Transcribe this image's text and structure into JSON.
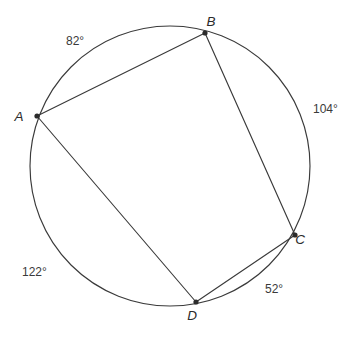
{
  "figure": {
    "type": "circle-with-inscribed-quadrilateral",
    "shape_name": "cyclic-quadrilateral-ABCD",
    "stroke_color": "#3a3a3a",
    "label_color": "#2b2b2b",
    "background_color": "#ffffff",
    "circle": {
      "center_x": 170,
      "center_y": 166,
      "radius": 140
    },
    "vertices": [
      {
        "id": "A",
        "label": "A",
        "x": 37,
        "y": 116,
        "label_x": 19,
        "label_y": 121
      },
      {
        "id": "B",
        "label": "B",
        "x": 205,
        "y": 33,
        "label_x": 211,
        "label_y": 26
      },
      {
        "id": "C",
        "label": "C",
        "x": 295,
        "y": 235,
        "label_x": 300,
        "label_y": 244
      },
      {
        "id": "D",
        "label": "D",
        "x": 196,
        "y": 302,
        "label_x": 192,
        "label_y": 320
      }
    ],
    "chords": [
      {
        "id": "AB",
        "from": "A",
        "to": "B"
      },
      {
        "id": "BC",
        "from": "B",
        "to": "C"
      },
      {
        "id": "CD",
        "from": "C",
        "to": "D"
      },
      {
        "id": "DA",
        "from": "D",
        "to": "A"
      }
    ],
    "arc_labels": [
      {
        "id": "arc-AB",
        "text": "82°",
        "x": 66,
        "y": 45,
        "arc_between": "A to B"
      },
      {
        "id": "arc-BC",
        "text": "104°",
        "x": 313,
        "y": 113,
        "arc_between": "B to C"
      },
      {
        "id": "arc-CD",
        "text": "52°",
        "x": 265,
        "y": 293,
        "arc_between": "C to D"
      },
      {
        "id": "arc-DA",
        "text": "122°",
        "x": 22,
        "y": 276,
        "arc_between": "D to A"
      }
    ]
  }
}
